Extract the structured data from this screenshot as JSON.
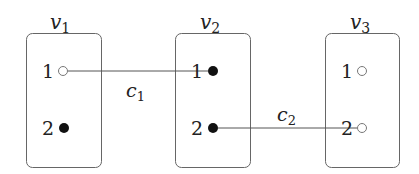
{
  "diagram": {
    "nodes": [
      {
        "id": "v1",
        "name": "v",
        "subscript": "1",
        "x": 26,
        "ports": [
          {
            "label": "1",
            "filled": false
          },
          {
            "label": "2",
            "filled": true
          }
        ]
      },
      {
        "id": "v2",
        "name": "v",
        "subscript": "2",
        "x": 175,
        "ports": [
          {
            "label": "1",
            "filled": true
          },
          {
            "label": "2",
            "filled": true
          }
        ]
      },
      {
        "id": "v3",
        "name": "v",
        "subscript": "3",
        "x": 325,
        "ports": [
          {
            "label": "1",
            "filled": false
          },
          {
            "label": "2",
            "filled": false
          }
        ]
      }
    ],
    "edges": [
      {
        "id": "c1",
        "name": "c",
        "subscript": "1",
        "from": "v1.1",
        "to": "v2.1"
      },
      {
        "id": "c2",
        "name": "c",
        "subscript": "2",
        "from": "v2.2",
        "to": "v3.2"
      }
    ],
    "colors": {
      "stroke": "#555555",
      "fill": "#111111",
      "text": "#222222"
    }
  }
}
